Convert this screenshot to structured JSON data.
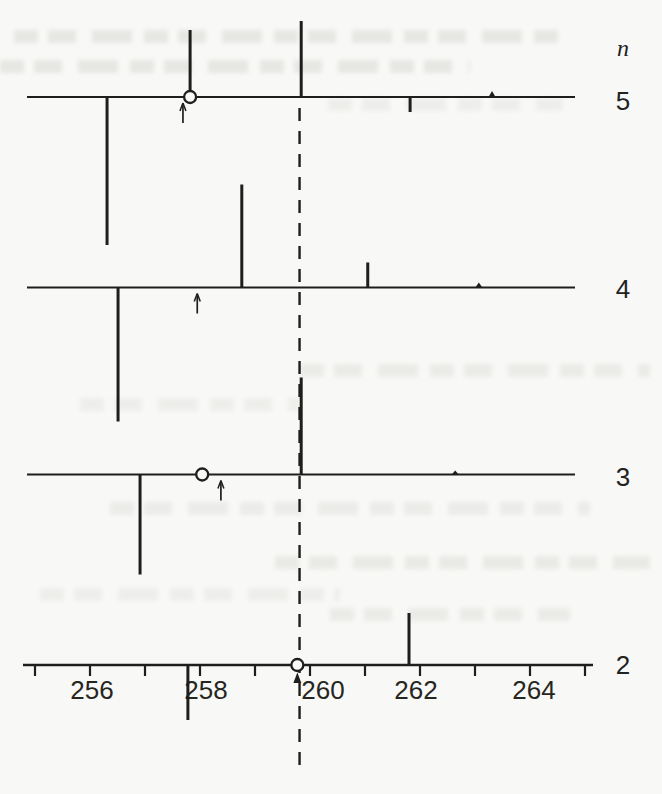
{
  "figure": {
    "header_label": "n",
    "description_colors": {
      "ink": "#1e1e1c",
      "paper": "#f8f8f6"
    }
  },
  "chart_data": {
    "type": "bar",
    "subtype": "stick-spectrum-multipanel",
    "title": "",
    "xlabel": "",
    "ylabel": "",
    "x_axis": {
      "min": 255,
      "max": 265,
      "minor_tick_step": 1,
      "labeled_ticks": [
        256,
        258,
        260,
        262,
        264
      ],
      "tick_labels": [
        "256",
        "258",
        "260",
        "262",
        "264"
      ]
    },
    "dashed_reference_x": 259.81,
    "panel_header": "n",
    "panels": [
      {
        "n": 5,
        "label": "5",
        "sticks": [
          {
            "x": 256.31,
            "length_px": -148
          },
          {
            "x": 257.82,
            "length_px": 67,
            "through_circle": true
          },
          {
            "x": 259.84,
            "length_px": 76
          },
          {
            "x": 261.82,
            "length_px": -15
          },
          {
            "x": 263.31,
            "length_px": 6,
            "bump": true
          }
        ],
        "circle_x": 257.82,
        "arrow_x": 257.69
      },
      {
        "n": 4,
        "label": "4",
        "sticks": [
          {
            "x": 256.51,
            "length_px": -134
          },
          {
            "x": 258.76,
            "length_px": 103
          },
          {
            "x": 261.05,
            "length_px": 25
          },
          {
            "x": 263.07,
            "length_px": 5,
            "bump": true
          }
        ],
        "arrow_x": 257.95
      },
      {
        "n": 3,
        "label": "3",
        "sticks": [
          {
            "x": 256.91,
            "length_px": -100
          },
          {
            "x": 259.84,
            "length_px": 97
          },
          {
            "x": 262.64,
            "length_px": 4,
            "bump": true
          }
        ],
        "circle_x": 258.04,
        "arrow_x": 258.38
      },
      {
        "n": 2,
        "label": "2",
        "sticks": [
          {
            "x": 257.78,
            "length_px": -55
          },
          {
            "x": 261.8,
            "length_px": 52
          }
        ],
        "circle_x": 259.77,
        "circle_arrowhead": true
      }
    ]
  }
}
